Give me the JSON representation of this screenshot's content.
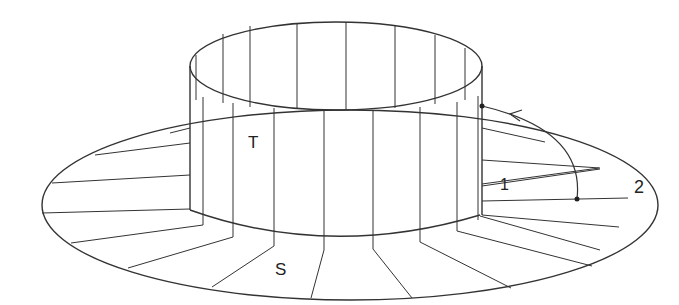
{
  "figure": {
    "labels": {
      "cylinder": "T",
      "annulus": "S",
      "point_inner": "1",
      "point_outer": "2"
    }
  }
}
